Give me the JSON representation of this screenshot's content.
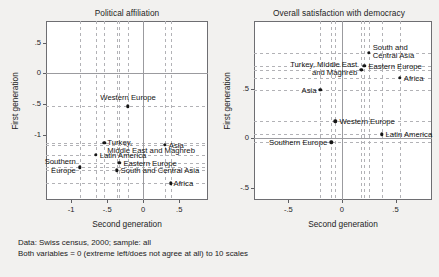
{
  "figure": {
    "notes": [
      "Data: Swiss census, 2000; sample: all",
      "Both variables = 0 (extreme left/does not agree at all) to 10 scales"
    ]
  },
  "chart_data": [
    {
      "type": "scatter",
      "title": "Political affiliation",
      "xlabel": "Second generation",
      "ylabel": "First generation",
      "xlim": [
        -1.35,
        0.9
      ],
      "ylim": [
        -2.05,
        0.85
      ],
      "xticks": [
        -1,
        -0.5,
        0,
        0.5
      ],
      "xticklabels": [
        "-1",
        "-.5",
        "0",
        ".5"
      ],
      "yticks": [
        0.5,
        0,
        -0.5,
        -1
      ],
      "yticklabels": [
        ".5",
        "0",
        "-.5",
        "-1"
      ],
      "grid": false,
      "reference_lines": {
        "x": 0,
        "y": 0
      },
      "points": [
        {
          "label": "Western Europe",
          "x": -0.21,
          "y": -0.53,
          "label_pos": "above"
        },
        {
          "label": "Turkey,\nMiddle East and Maghreb",
          "x": -0.54,
          "y": -1.12,
          "label_pos": "below-right"
        },
        {
          "label": "Asia",
          "x": 0.3,
          "y": -1.16,
          "label_pos": "right"
        },
        {
          "label": "Latin America",
          "x": -0.66,
          "y": -1.32,
          "label_pos": "right"
        },
        {
          "label": "Southern\nEurope",
          "x": -0.88,
          "y": -1.52,
          "label_pos": "left"
        },
        {
          "label": "Eastern Europe",
          "x": -0.33,
          "y": -1.45,
          "label_pos": "right"
        },
        {
          "label": "South and Central Asia",
          "x": -0.37,
          "y": -1.57,
          "label_pos": "right"
        },
        {
          "label": "Africa",
          "x": 0.38,
          "y": -1.78,
          "label_pos": "below-right"
        }
      ]
    },
    {
      "type": "scatter",
      "title": "Overall satisfaction with democracy",
      "xlabel": "Second generation",
      "ylabel": "First generation",
      "xlim": [
        -0.82,
        0.84
      ],
      "ylim": [
        -0.62,
        1.18
      ],
      "xticks": [
        -0.5,
        0,
        0.5
      ],
      "xticklabels": [
        "-.5",
        "0",
        ".5"
      ],
      "yticks": [
        0.5,
        0,
        -0.5
      ],
      "yticklabels": [
        ".5",
        "0",
        "-.5"
      ],
      "grid": false,
      "reference_lines": {
        "x": 0,
        "y": 0
      },
      "points": [
        {
          "label": "South and\nCentral Asia",
          "x": 0.25,
          "y": 0.86,
          "label_pos": "right"
        },
        {
          "label": "Eastern Europe",
          "x": 0.21,
          "y": 0.73,
          "label_pos": "right"
        },
        {
          "label": "Turkey, Middle East\nand Maghreb",
          "x": 0.18,
          "y": 0.69,
          "label_pos": "left"
        },
        {
          "label": "Africa",
          "x": 0.54,
          "y": 0.61,
          "label_pos": "right"
        },
        {
          "label": "Asia",
          "x": -0.2,
          "y": 0.49,
          "label_pos": "left"
        },
        {
          "label": "Western Europe",
          "x": -0.06,
          "y": 0.17,
          "label_pos": "right"
        },
        {
          "label": "Latin America",
          "x": 0.37,
          "y": 0.04,
          "label_pos": "right"
        },
        {
          "label": "Southern Europe",
          "x": -0.1,
          "y": -0.04,
          "label_pos": "left"
        }
      ]
    }
  ]
}
